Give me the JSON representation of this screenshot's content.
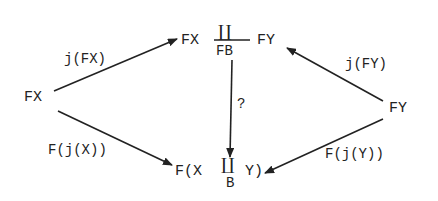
{
  "diagram": {
    "type": "commutative-diagram",
    "nodes": {
      "left": {
        "label": "FX"
      },
      "right": {
        "label": "FY"
      },
      "top": {
        "left_part": "FX",
        "coproduct_symbol": "∐",
        "subscript": "FB",
        "right_part": "FY"
      },
      "bottom": {
        "prefix": "F(X",
        "coproduct_symbol": "∐",
        "subscript": "B",
        "suffix": "Y)"
      }
    },
    "edges": [
      {
        "from": "left",
        "to": "top",
        "label": "j(FX)"
      },
      {
        "from": "left",
        "to": "bottom",
        "label": "F(j(X))"
      },
      {
        "from": "right",
        "to": "top",
        "label": "j(FY)"
      },
      {
        "from": "right",
        "to": "bottom",
        "label": "F(j(Y))"
      },
      {
        "from": "top",
        "to": "bottom",
        "label": "?"
      }
    ],
    "colors": {
      "ink": "#222222",
      "background": "#ffffff"
    }
  }
}
